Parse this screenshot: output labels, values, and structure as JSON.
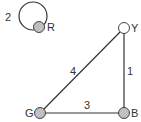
{
  "diagram": {
    "type": "graph",
    "nodes": [
      {
        "id": "R",
        "label": "R",
        "x": 39,
        "y": 27,
        "fill": "hatched"
      },
      {
        "id": "Y",
        "label": "Y",
        "x": 124,
        "y": 28,
        "fill": "white"
      },
      {
        "id": "B",
        "label": "B",
        "x": 124,
        "y": 113,
        "fill": "hatched"
      },
      {
        "id": "G",
        "label": "G",
        "x": 40,
        "y": 113,
        "fill": "hatched"
      }
    ],
    "edges": [
      {
        "from": "R",
        "to": "R",
        "weight": "2",
        "kind": "self-loop"
      },
      {
        "from": "Y",
        "to": "B",
        "weight": "1"
      },
      {
        "from": "G",
        "to": "B",
        "weight": "3"
      },
      {
        "from": "G",
        "to": "Y",
        "weight": "4"
      }
    ]
  },
  "labels": {
    "loop_weight": "2",
    "yb_weight": "1",
    "gb_weight": "3",
    "gy_weight": "4",
    "node_r": "R",
    "node_y": "Y",
    "node_b": "B",
    "node_g": "G"
  },
  "colors": {
    "line": "#333333",
    "node_stroke": "#444444",
    "hatch_fill": "#b8b8b8",
    "background": "#ffffff"
  }
}
